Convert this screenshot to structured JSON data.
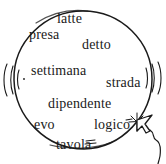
{
  "scene": {
    "title": "word-balloon-illustration",
    "description": "Hand-drawn oval balloon filled with Italian words, vibration marks on both sides, and a mouse cursor clicking the word 'logico'",
    "background_color": "#ffffff",
    "ink_color": "#1a1a1a"
  },
  "balloon": {
    "name": "balloon-outline",
    "shape": "ellipse",
    "center_x": 83,
    "center_y": 80,
    "radius_x": 69,
    "radius_y": 68,
    "stroke_color": "#1a1a1a"
  },
  "words": [
    {
      "text": "latte",
      "x": 57,
      "y": 12,
      "size": 14
    },
    {
      "text": "presa",
      "x": 29,
      "y": 28,
      "size": 14
    },
    {
      "text": "detto",
      "x": 82,
      "y": 38,
      "size": 14
    },
    {
      "text": "settimana",
      "x": 31,
      "y": 64,
      "size": 14
    },
    {
      "text": "strada",
      "x": 106,
      "y": 76,
      "size": 14
    },
    {
      "text": "dipendente",
      "x": 48,
      "y": 97,
      "size": 14
    },
    {
      "text": "evo",
      "x": 34,
      "y": 118,
      "size": 14
    },
    {
      "text": "logico",
      "x": 94,
      "y": 118,
      "size": 14
    },
    {
      "text": "tavola",
      "x": 56,
      "y": 138,
      "size": 14
    }
  ],
  "vibration_marks": {
    "name": "motion-lines",
    "left_count": 3,
    "right_count": 3,
    "left_x": 9,
    "right_x": 150,
    "y": 78
  },
  "cursor": {
    "name": "mouse-cursor",
    "tip_x": 137,
    "tip_y": 122,
    "sparkle": true,
    "sparkle_rays": 8,
    "has_tail": true,
    "target_word": "logico"
  },
  "marks": [
    {
      "name": "tavola-underline-mark",
      "x": 86,
      "y": 142
    },
    {
      "name": "logico-dash-mark",
      "x": 126,
      "y": 119
    }
  ]
}
